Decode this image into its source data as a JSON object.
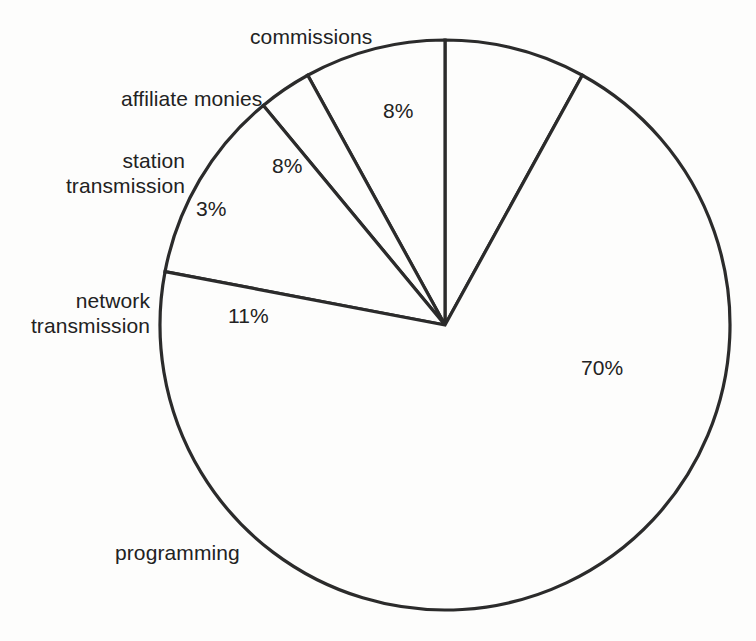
{
  "chart_data": {
    "type": "pie",
    "title": "",
    "subtitle": "",
    "xlabel": "",
    "ylabel": "",
    "legend_position": "none",
    "grid": false,
    "start_angle_deg": 0,
    "direction": "clockwise-and-counterclockwise-from-top",
    "categories": [
      "commissions",
      "affiliate monies",
      "station transmission",
      "network transmission",
      "programming"
    ],
    "values": [
      8,
      8,
      3,
      11,
      70
    ],
    "value_labels": [
      "8%",
      "8%",
      "3%",
      "11%",
      "70%"
    ],
    "units": "percent",
    "total": 100,
    "slices": [
      {
        "name": "commissions",
        "value": 8,
        "value_label": "8%",
        "label": "commissions",
        "label_lines": [
          "commissions"
        ]
      },
      {
        "name": "affiliate monies",
        "value": 8,
        "value_label": "8%",
        "label": "affiliate monies",
        "label_lines": [
          "affiliate monies"
        ]
      },
      {
        "name": "station transmission",
        "value": 3,
        "value_label": "3%",
        "label": "station transmission",
        "label_lines": [
          "station",
          "transmission"
        ]
      },
      {
        "name": "network transmission",
        "value": 11,
        "value_label": "11%",
        "label": "network transmission",
        "label_lines": [
          "network",
          "transmission"
        ]
      },
      {
        "name": "programming",
        "value": 70,
        "value_label": "70%",
        "label": "programming",
        "label_lines": [
          "programming"
        ]
      }
    ],
    "colors": {
      "slice_fill": "#fdfdfc",
      "slice_stroke": "#2b2b2b",
      "text": "#222222",
      "background": "#fdfdfc"
    }
  },
  "labels": {
    "commissions": "commissions",
    "affiliate_monies": "affiliate monies",
    "station_line1": "station",
    "station_line2": "transmission",
    "network_line1": "network",
    "network_line2": "transmission",
    "programming": "programming"
  },
  "values": {
    "commissions": "8%",
    "affiliate_monies": "8%",
    "station_transmission": "3%",
    "network_transmission": "11%",
    "programming": "70%"
  }
}
